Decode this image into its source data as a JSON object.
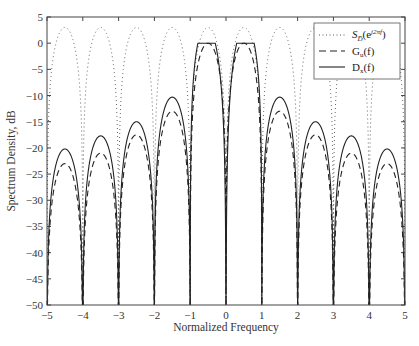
{
  "chart_data": {
    "type": "line",
    "title": "",
    "xlabel": "Normalized Frequency",
    "ylabel": "Spectrum Density, dB",
    "xlim": [
      -5,
      5
    ],
    "ylim": [
      -50,
      5
    ],
    "xticks": [
      -5,
      -4,
      -3,
      -2,
      -1,
      0,
      1,
      2,
      3,
      4,
      5
    ],
    "xtick_labels": [
      "−5",
      "−4",
      "−3",
      "−2",
      "−1",
      "0",
      "1",
      "2",
      "3",
      "4",
      "5"
    ],
    "yticks": [
      5,
      0,
      -5,
      -10,
      -15,
      -20,
      -25,
      -30,
      -35,
      -40,
      -45,
      -50
    ],
    "ytick_labels": [
      "5",
      "0",
      "−5",
      "−10",
      "−15",
      "−20",
      "−25",
      "−30",
      "−35",
      "−40",
      "−45",
      "−50"
    ],
    "grid": false,
    "legend_position": "upper right",
    "series": [
      {
        "name": "S_D(e^{j2πf})",
        "style": "dotted",
        "description": "Periodic spectrum peaking at about +3 dB at half-integer frequencies, nulls at integers",
        "peaks": [
          {
            "x": -4.5,
            "y": 3
          },
          {
            "x": -3.5,
            "y": 3
          },
          {
            "x": -2.5,
            "y": 3
          },
          {
            "x": -1.5,
            "y": 3
          },
          {
            "x": -0.5,
            "y": 3
          },
          {
            "x": 0.5,
            "y": 3
          },
          {
            "x": 1.5,
            "y": 3
          },
          {
            "x": 2.5,
            "y": 3
          },
          {
            "x": 3.5,
            "y": 3
          },
          {
            "x": 4.5,
            "y": 3
          }
        ]
      },
      {
        "name": "G_u(f)",
        "style": "dashed",
        "description": "Envelope slightly below D_x side lobes; main lobe ~0 dB near f=±0.25",
        "peaks": [
          {
            "x": -4.5,
            "y": -23
          },
          {
            "x": -3.5,
            "y": -21
          },
          {
            "x": -2.5,
            "y": -17.5
          },
          {
            "x": -1.5,
            "y": -13
          },
          {
            "x": -0.25,
            "y": 0
          },
          {
            "x": 0.25,
            "y": 0
          },
          {
            "x": 1.5,
            "y": -13
          },
          {
            "x": 2.5,
            "y": -17.5
          },
          {
            "x": 3.5,
            "y": -21
          },
          {
            "x": 4.5,
            "y": -23
          }
        ]
      },
      {
        "name": "D_x(f)",
        "style": "solid",
        "description": "Main lobes ~0 dB at f≈±0.3 with null at 0; side lobes decreasing outward, nulls at integers",
        "peaks": [
          {
            "x": -4.5,
            "y": -20.2
          },
          {
            "x": -3.5,
            "y": -17.7
          },
          {
            "x": -2.5,
            "y": -15
          },
          {
            "x": -1.5,
            "y": -10.3
          },
          {
            "x": -0.3,
            "y": 0
          },
          {
            "x": 0.3,
            "y": 0
          },
          {
            "x": 1.5,
            "y": -10.3
          },
          {
            "x": 2.5,
            "y": -15
          },
          {
            "x": 3.5,
            "y": -17.7
          },
          {
            "x": 4.5,
            "y": -20.2
          }
        ]
      }
    ]
  },
  "legend": {
    "items": [
      {
        "label_main": "S",
        "label_sub": "D̅",
        "label_paren": "(e",
        "label_sup": "j2πf",
        "label_close": ")",
        "style": "dotted"
      },
      {
        "label": "G",
        "sub": "u",
        "rest": "(f)",
        "style": "dashed"
      },
      {
        "label": "D",
        "sub": "x",
        "rest": "(f)",
        "style": "solid"
      }
    ]
  }
}
